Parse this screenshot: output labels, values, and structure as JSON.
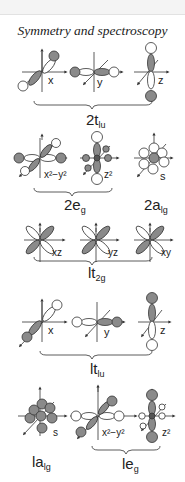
{
  "header": {
    "title": "Symmetry and spectroscopy"
  },
  "axes": {
    "x": "x",
    "y": "y",
    "z": "z"
  },
  "groups": [
    {
      "id": "2t1u",
      "label_main": "2t",
      "label_sub": "lu",
      "orbitals": [
        "x",
        "y",
        "z"
      ]
    },
    {
      "id": "2eg",
      "label_main": "2e",
      "label_sub": "g",
      "orbitals": [
        "x²−y²",
        "z²"
      ]
    },
    {
      "id": "2a1g",
      "label_main": "2a",
      "label_sub": "lg",
      "orbitals": [
        "s"
      ]
    },
    {
      "id": "1t2g",
      "label_main": "lt",
      "label_sub": "2g",
      "orbitals": [
        "xz",
        "yz",
        "xy"
      ]
    },
    {
      "id": "1t1u",
      "label_main": "lt",
      "label_sub": "lu",
      "orbitals": [
        "x",
        "y",
        "z"
      ]
    },
    {
      "id": "1a1g",
      "label_main": "la",
      "label_sub": "lg",
      "orbitals": [
        "s"
      ]
    },
    {
      "id": "1eg",
      "label_main": "le",
      "label_sub": "g",
      "orbitals": [
        "x²−y²",
        "z²"
      ]
    }
  ],
  "colors": {
    "shaded": "#8a8a8a",
    "open": "#ffffff",
    "stroke": "#333333"
  }
}
